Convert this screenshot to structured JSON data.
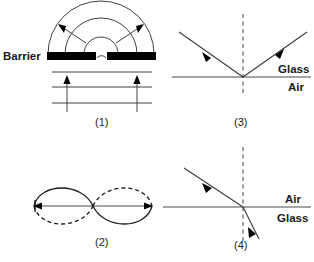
{
  "figure": {
    "title": "",
    "background_color": "#ffffff",
    "ink_color": "#1a1a1a",
    "width": 314,
    "height": 262
  },
  "panels": [
    {
      "id": "panel-1",
      "caption": "(1)",
      "phenomenon": "diffraction-through-single-gap",
      "labels": {
        "barrier": "Barrier"
      },
      "elements": {
        "incoming_wavefronts": 3,
        "diffracted_arcs": 3,
        "propagation_arrows": 2,
        "barrier_segments": 2
      }
    },
    {
      "id": "panel-2",
      "caption": "(2)",
      "phenomenon": "standing-wave-two-loops",
      "labels": {},
      "elements": {
        "loops": 2,
        "nodes": 3,
        "antinodes": 2,
        "solid_envelope": true,
        "dashed_envelope": true,
        "end_arrows": 2
      }
    },
    {
      "id": "panel-3",
      "caption": "(3)",
      "phenomenon": "reflection-at-boundary",
      "labels": {
        "upper_medium": "Glass",
        "lower_medium": "Air"
      },
      "elements": {
        "normal_is_dashed": true,
        "incident_ray": 1,
        "reflected_ray": 1,
        "ray_arrows": 2
      }
    },
    {
      "id": "panel-4",
      "caption": "(4)",
      "phenomenon": "refraction-at-boundary",
      "labels": {
        "upper_medium": "Air",
        "lower_medium": "Glass"
      },
      "elements": {
        "normal_is_dashed": true,
        "incident_ray": 1,
        "refracted_ray": 1,
        "ray_arrows": 2
      }
    }
  ]
}
